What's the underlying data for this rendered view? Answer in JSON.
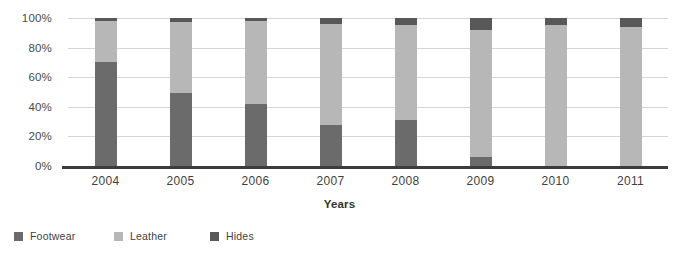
{
  "chart_data": {
    "type": "bar",
    "subtype": "stacked-percentage",
    "title": "",
    "xlabel": "Years",
    "ylabel": "",
    "categories": [
      "2004",
      "2005",
      "2006",
      "2007",
      "2008",
      "2009",
      "2010",
      "2011"
    ],
    "ylim": [
      0,
      100
    ],
    "ytick_labels": [
      "0%",
      "20%",
      "40%",
      "60%",
      "80%",
      "100%"
    ],
    "ytick_values": [
      0,
      20,
      40,
      60,
      80,
      100
    ],
    "grid": true,
    "legend_position": "bottom-left",
    "series": [
      {
        "name": "Footwear",
        "color": "#6b6b6b",
        "values": [
          70,
          49,
          42,
          28,
          31,
          6,
          0,
          0
        ]
      },
      {
        "name": "Leather",
        "color": "#b7b7b7",
        "values": [
          28,
          48,
          56,
          68,
          64,
          86,
          95,
          94
        ]
      },
      {
        "name": "Hides",
        "color": "#585858",
        "values": [
          2,
          3,
          2,
          4,
          5,
          8,
          5,
          6
        ]
      }
    ]
  },
  "axis": {
    "x_title": "Years"
  },
  "colors": {
    "footwear": "#6b6b6b",
    "leather": "#b7b7b7",
    "hides": "#585858",
    "gridline": "#d6d6d6",
    "axis": "#3c3c3c",
    "background": "#ffffff"
  }
}
